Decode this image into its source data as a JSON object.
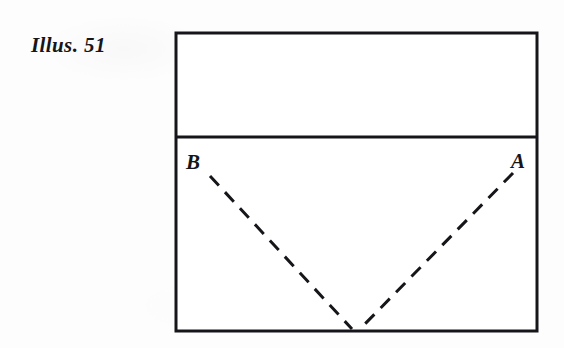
{
  "figure": {
    "caption": "Illus. 51"
  },
  "diagram": {
    "labels": {
      "left_vertex": "B",
      "right_vertex": "A"
    },
    "colors": {
      "ink": "#16161a",
      "paper": "#fdfdfd",
      "dash": "#16161a"
    },
    "geometry": {
      "rect_left": 176,
      "rect_top": 33,
      "rect_right": 537,
      "rect_bottom": 331,
      "divider_y": 137,
      "apex_x": 356,
      "apex_y": 330,
      "border_width": 3,
      "divider_width": 3,
      "dash_width": 3,
      "dash_pattern": "13 9"
    }
  }
}
